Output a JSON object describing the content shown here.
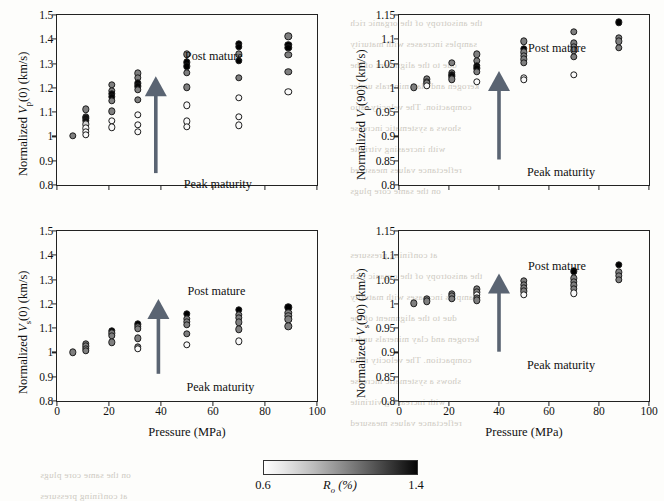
{
  "figure": {
    "xlabel": "Pressure (MPa)",
    "xticks": [
      "0",
      "20",
      "40",
      "60",
      "80",
      "100"
    ],
    "annotation_top": "Post mature",
    "annotation_bottom": "Peak maturity",
    "arrow_color": "#5a6472",
    "colorbar": {
      "label_html": "R<sub>o</sub> (%)",
      "min_label": "0.6",
      "max_label": "1.4",
      "low_color": "#ffffff",
      "high_color": "#000000"
    }
  },
  "chart_data": [
    {
      "id": "panel-top-left",
      "type": "scatter",
      "title": "",
      "ylabel": "Normalized Vp(0) (km/s)",
      "ylabel_html": "Normalized <i>V</i><sub>p</sub>(0) (km/s)",
      "xlabel": "Pressure (MPa)",
      "xlim": [
        0,
        100
      ],
      "ylim": [
        0.8,
        1.5
      ],
      "yticks": [
        "0.8",
        "0.9",
        "1",
        "1.1",
        "1.2",
        "1.3",
        "1.4",
        "1.5"
      ],
      "grid": false,
      "legend": "colorbar: Ro (%) 0.6-1.4 grayscale",
      "colorbar_range": [
        0.6,
        1.4
      ],
      "points": [
        {
          "x": 6,
          "y": 1.002,
          "ro": 1.0
        },
        {
          "x": 11,
          "y": 1.112,
          "ro": 1.0
        },
        {
          "x": 11,
          "y": 1.082,
          "ro": 1.0
        },
        {
          "x": 11,
          "y": 1.074,
          "ro": 1.35
        },
        {
          "x": 11,
          "y": 1.064,
          "ro": 1.35
        },
        {
          "x": 11,
          "y": 1.05,
          "ro": 0.75
        },
        {
          "x": 11,
          "y": 1.034,
          "ro": 0.62
        },
        {
          "x": 11,
          "y": 1.02,
          "ro": 0.62
        },
        {
          "x": 11,
          "y": 1.006,
          "ro": 0.62
        },
        {
          "x": 21,
          "y": 1.212,
          "ro": 1.0
        },
        {
          "x": 21,
          "y": 1.188,
          "ro": 1.0
        },
        {
          "x": 21,
          "y": 1.176,
          "ro": 1.38
        },
        {
          "x": 21,
          "y": 1.162,
          "ro": 1.38
        },
        {
          "x": 21,
          "y": 1.146,
          "ro": 1.0
        },
        {
          "x": 21,
          "y": 1.104,
          "ro": 1.0
        },
        {
          "x": 21,
          "y": 1.064,
          "ro": 0.62
        },
        {
          "x": 21,
          "y": 1.038,
          "ro": 0.62
        },
        {
          "x": 31,
          "y": 1.26,
          "ro": 1.0
        },
        {
          "x": 31,
          "y": 1.242,
          "ro": 1.0
        },
        {
          "x": 31,
          "y": 1.218,
          "ro": 1.38
        },
        {
          "x": 31,
          "y": 1.206,
          "ro": 1.38
        },
        {
          "x": 31,
          "y": 1.192,
          "ro": 1.0
        },
        {
          "x": 31,
          "y": 1.152,
          "ro": 1.0
        },
        {
          "x": 31,
          "y": 1.088,
          "ro": 0.62
        },
        {
          "x": 31,
          "y": 1.048,
          "ro": 0.62
        },
        {
          "x": 31,
          "y": 1.02,
          "ro": 0.62
        },
        {
          "x": 50,
          "y": 1.338,
          "ro": 1.0
        },
        {
          "x": 50,
          "y": 1.306,
          "ro": 1.42
        },
        {
          "x": 50,
          "y": 1.288,
          "ro": 1.42
        },
        {
          "x": 50,
          "y": 1.262,
          "ro": 1.0
        },
        {
          "x": 50,
          "y": 1.202,
          "ro": 1.0
        },
        {
          "x": 50,
          "y": 1.128,
          "ro": 0.62
        },
        {
          "x": 50,
          "y": 1.062,
          "ro": 0.62
        },
        {
          "x": 50,
          "y": 1.04,
          "ro": 0.62
        },
        {
          "x": 70,
          "y": 1.382,
          "ro": 1.42
        },
        {
          "x": 70,
          "y": 1.368,
          "ro": 1.42
        },
        {
          "x": 70,
          "y": 1.338,
          "ro": 1.0
        },
        {
          "x": 70,
          "y": 1.312,
          "ro": 1.42
        },
        {
          "x": 70,
          "y": 1.242,
          "ro": 1.0
        },
        {
          "x": 70,
          "y": 1.16,
          "ro": 0.62
        },
        {
          "x": 70,
          "y": 1.08,
          "ro": 0.62
        },
        {
          "x": 70,
          "y": 1.046,
          "ro": 0.62
        },
        {
          "x": 89,
          "y": 1.412,
          "ro": 1.0
        },
        {
          "x": 89,
          "y": 1.378,
          "ro": 1.42
        },
        {
          "x": 89,
          "y": 1.366,
          "ro": 1.42
        },
        {
          "x": 89,
          "y": 1.336,
          "ro": 1.0
        },
        {
          "x": 89,
          "y": 1.266,
          "ro": 1.0
        },
        {
          "x": 89,
          "y": 1.184,
          "ro": 0.62
        }
      ]
    },
    {
      "id": "panel-top-right",
      "type": "scatter",
      "title": "",
      "ylabel": "Normalized Vp(90) (km/s)",
      "ylabel_html": "Normalized <i>V</i><sub>p</sub>(90) (km/s)",
      "xlabel": "Pressure (MPa)",
      "xlim": [
        0,
        100
      ],
      "ylim": [
        0.8,
        1.15
      ],
      "yticks": [
        "0.8",
        "0.85",
        "0.9",
        "0.95",
        "1",
        "1.05",
        "1.1",
        "1.15"
      ],
      "grid": false,
      "colorbar_range": [
        0.6,
        1.4
      ],
      "points": [
        {
          "x": 6,
          "y": 1.001,
          "ro": 1.0
        },
        {
          "x": 11,
          "y": 1.018,
          "ro": 1.0
        },
        {
          "x": 11,
          "y": 1.013,
          "ro": 1.0
        },
        {
          "x": 11,
          "y": 1.009,
          "ro": 1.0
        },
        {
          "x": 11,
          "y": 1.004,
          "ro": 0.62
        },
        {
          "x": 21,
          "y": 1.051,
          "ro": 1.0
        },
        {
          "x": 21,
          "y": 1.031,
          "ro": 1.0
        },
        {
          "x": 21,
          "y": 1.027,
          "ro": 1.38
        },
        {
          "x": 21,
          "y": 1.024,
          "ro": 1.38
        },
        {
          "x": 21,
          "y": 1.018,
          "ro": 1.0
        },
        {
          "x": 31,
          "y": 1.069,
          "ro": 1.0
        },
        {
          "x": 31,
          "y": 1.056,
          "ro": 1.0
        },
        {
          "x": 31,
          "y": 1.046,
          "ro": 1.38
        },
        {
          "x": 31,
          "y": 1.04,
          "ro": 1.38
        },
        {
          "x": 31,
          "y": 1.033,
          "ro": 1.0
        },
        {
          "x": 31,
          "y": 1.013,
          "ro": 0.62
        },
        {
          "x": 50,
          "y": 1.096,
          "ro": 1.0
        },
        {
          "x": 50,
          "y": 1.081,
          "ro": 1.42
        },
        {
          "x": 50,
          "y": 1.073,
          "ro": 1.0
        },
        {
          "x": 50,
          "y": 1.066,
          "ro": 1.0
        },
        {
          "x": 50,
          "y": 1.059,
          "ro": 1.0
        },
        {
          "x": 50,
          "y": 1.052,
          "ro": 1.0
        },
        {
          "x": 50,
          "y": 1.021,
          "ro": 0.62
        },
        {
          "x": 50,
          "y": 1.017,
          "ro": 0.62
        },
        {
          "x": 70,
          "y": 1.116,
          "ro": 1.0
        },
        {
          "x": 70,
          "y": 1.092,
          "ro": 1.0
        },
        {
          "x": 70,
          "y": 1.085,
          "ro": 1.0
        },
        {
          "x": 70,
          "y": 1.077,
          "ro": 1.0
        },
        {
          "x": 70,
          "y": 1.064,
          "ro": 1.0
        },
        {
          "x": 70,
          "y": 1.027,
          "ro": 0.62
        },
        {
          "x": 88,
          "y": 1.135,
          "ro": 1.42
        },
        {
          "x": 88,
          "y": 1.103,
          "ro": 1.0
        },
        {
          "x": 88,
          "y": 1.096,
          "ro": 1.0
        },
        {
          "x": 88,
          "y": 1.083,
          "ro": 1.0
        }
      ]
    },
    {
      "id": "panel-bottom-left",
      "type": "scatter",
      "title": "",
      "ylabel": "Normalized Vs(0) (km/s)",
      "ylabel_html": "Normalized <i>V</i><sub>s</sub>(0) (km/s)",
      "xlabel": "Pressure (MPa)",
      "xlim": [
        0,
        100
      ],
      "ylim": [
        0.8,
        1.5
      ],
      "yticks": [
        "0.8",
        "0.9",
        "1",
        "1.1",
        "1.2",
        "1.3",
        "1.4",
        "1.5"
      ],
      "grid": false,
      "colorbar_range": [
        0.6,
        1.4
      ],
      "points": [
        {
          "x": 6,
          "y": 1.001,
          "ro": 1.0
        },
        {
          "x": 11,
          "y": 1.036,
          "ro": 1.0
        },
        {
          "x": 11,
          "y": 1.026,
          "ro": 1.0
        },
        {
          "x": 11,
          "y": 1.016,
          "ro": 1.0
        },
        {
          "x": 11,
          "y": 1.006,
          "ro": 1.0
        },
        {
          "x": 21,
          "y": 1.09,
          "ro": 1.42
        },
        {
          "x": 21,
          "y": 1.078,
          "ro": 1.0
        },
        {
          "x": 21,
          "y": 1.068,
          "ro": 1.0
        },
        {
          "x": 21,
          "y": 1.042,
          "ro": 1.0
        },
        {
          "x": 31,
          "y": 1.116,
          "ro": 1.42
        },
        {
          "x": 31,
          "y": 1.106,
          "ro": 1.0
        },
        {
          "x": 31,
          "y": 1.098,
          "ro": 1.0
        },
        {
          "x": 31,
          "y": 1.058,
          "ro": 1.0
        },
        {
          "x": 31,
          "y": 1.024,
          "ro": 1.0
        },
        {
          "x": 31,
          "y": 1.016,
          "ro": 0.62
        },
        {
          "x": 50,
          "y": 1.158,
          "ro": 1.42
        },
        {
          "x": 50,
          "y": 1.138,
          "ro": 1.0
        },
        {
          "x": 50,
          "y": 1.126,
          "ro": 1.0
        },
        {
          "x": 50,
          "y": 1.114,
          "ro": 1.0
        },
        {
          "x": 50,
          "y": 1.076,
          "ro": 1.0
        },
        {
          "x": 50,
          "y": 1.032,
          "ro": 0.62
        },
        {
          "x": 70,
          "y": 1.176,
          "ro": 1.42
        },
        {
          "x": 70,
          "y": 1.154,
          "ro": 1.0
        },
        {
          "x": 70,
          "y": 1.142,
          "ro": 1.0
        },
        {
          "x": 70,
          "y": 1.124,
          "ro": 1.0
        },
        {
          "x": 70,
          "y": 1.096,
          "ro": 1.0
        },
        {
          "x": 70,
          "y": 1.046,
          "ro": 0.62
        },
        {
          "x": 89,
          "y": 1.186,
          "ro": 1.42
        },
        {
          "x": 89,
          "y": 1.162,
          "ro": 1.0
        },
        {
          "x": 89,
          "y": 1.15,
          "ro": 1.0
        },
        {
          "x": 89,
          "y": 1.136,
          "ro": 1.0
        },
        {
          "x": 89,
          "y": 1.108,
          "ro": 1.0
        }
      ]
    },
    {
      "id": "panel-bottom-right",
      "type": "scatter",
      "title": "",
      "ylabel": "Normalized Vs(90) (km/s)",
      "ylabel_html": "Normalized <i>V</i><sub>s</sub>(90) (km/s)",
      "xlabel": "Pressure (MPa)",
      "xlim": [
        0,
        100
      ],
      "ylim": [
        0.8,
        1.15
      ],
      "yticks": [
        "0.8",
        "0.85",
        "0.9",
        "0.95",
        "1",
        "1.05",
        "1.1",
        "1.15"
      ],
      "grid": false,
      "colorbar_range": [
        0.6,
        1.4
      ],
      "points": [
        {
          "x": 6,
          "y": 1.001,
          "ro": 1.0
        },
        {
          "x": 11,
          "y": 1.01,
          "ro": 1.0
        },
        {
          "x": 11,
          "y": 1.005,
          "ro": 1.0
        },
        {
          "x": 21,
          "y": 1.021,
          "ro": 1.0
        },
        {
          "x": 21,
          "y": 1.016,
          "ro": 1.0
        },
        {
          "x": 21,
          "y": 1.011,
          "ro": 1.0
        },
        {
          "x": 31,
          "y": 1.03,
          "ro": 1.0
        },
        {
          "x": 31,
          "y": 1.024,
          "ro": 1.0
        },
        {
          "x": 31,
          "y": 1.019,
          "ro": 0.62
        },
        {
          "x": 31,
          "y": 1.012,
          "ro": 1.0
        },
        {
          "x": 31,
          "y": 1.007,
          "ro": 1.0
        },
        {
          "x": 50,
          "y": 1.047,
          "ro": 1.0
        },
        {
          "x": 50,
          "y": 1.039,
          "ro": 1.0
        },
        {
          "x": 50,
          "y": 1.032,
          "ro": 1.0
        },
        {
          "x": 50,
          "y": 1.026,
          "ro": 1.0
        },
        {
          "x": 50,
          "y": 1.019,
          "ro": 0.62
        },
        {
          "x": 70,
          "y": 1.067,
          "ro": 1.42
        },
        {
          "x": 70,
          "y": 1.053,
          "ro": 1.0
        },
        {
          "x": 70,
          "y": 1.046,
          "ro": 1.0
        },
        {
          "x": 70,
          "y": 1.038,
          "ro": 1.0
        },
        {
          "x": 70,
          "y": 1.031,
          "ro": 1.0
        },
        {
          "x": 70,
          "y": 1.022,
          "ro": 0.62
        },
        {
          "x": 88,
          "y": 1.08,
          "ro": 1.42
        },
        {
          "x": 88,
          "y": 1.065,
          "ro": 1.0
        },
        {
          "x": 88,
          "y": 1.058,
          "ro": 1.0
        },
        {
          "x": 88,
          "y": 1.05,
          "ro": 1.0
        }
      ]
    }
  ],
  "bleed_text": [
    "the anisotropy of the organic rich",
    "samples increases with maturity",
    "due to the alignment of the",
    "kerogen and clay minerals under",
    "compaction. The velocity ratio",
    "shows a systematic increase",
    "with increasing vitrinite",
    "reflectance values measured",
    "on the same core plugs",
    "at confining pressures"
  ]
}
